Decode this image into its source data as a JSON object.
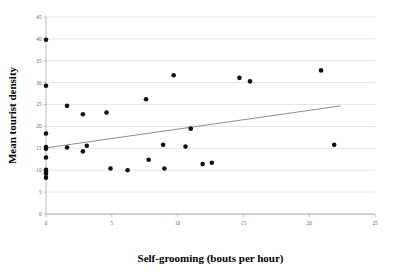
{
  "chart_data": {
    "type": "scatter",
    "title": "",
    "xlabel": "Self-grooming (bouts per hour)",
    "ylabel": "Mean tourist density",
    "xlim": [
      0,
      25
    ],
    "ylim": [
      0,
      45
    ],
    "xticks": [
      "0",
      "5",
      "10",
      "15",
      "20",
      "25"
    ],
    "xtick_values": [
      0,
      5,
      10,
      15,
      20,
      25
    ],
    "yticks": [
      "0",
      "5",
      "10",
      "15",
      "20",
      "25",
      "30",
      "35",
      "40",
      "45"
    ],
    "ytick_values": [
      0,
      5,
      10,
      15,
      20,
      25,
      30,
      35,
      40,
      45
    ],
    "grid": true,
    "legend": false,
    "legend_position": "none",
    "marker": "filled-circle",
    "marker_color": "#111111",
    "points": [
      {
        "x": 0.0,
        "y": 39.8
      },
      {
        "x": 0.0,
        "y": 29.3
      },
      {
        "x": 0.0,
        "y": 18.4
      },
      {
        "x": 0.0,
        "y": 15.3
      },
      {
        "x": 0.0,
        "y": 14.9
      },
      {
        "x": 0.0,
        "y": 12.9
      },
      {
        "x": 0.0,
        "y": 10.1
      },
      {
        "x": 0.0,
        "y": 9.6
      },
      {
        "x": 0.0,
        "y": 9.2
      },
      {
        "x": 0.0,
        "y": 8.3
      },
      {
        "x": 1.6,
        "y": 24.7
      },
      {
        "x": 1.6,
        "y": 15.2
      },
      {
        "x": 2.8,
        "y": 22.8
      },
      {
        "x": 2.8,
        "y": 14.3
      },
      {
        "x": 3.1,
        "y": 15.6
      },
      {
        "x": 4.6,
        "y": 23.2
      },
      {
        "x": 4.9,
        "y": 10.4
      },
      {
        "x": 6.2,
        "y": 10.0
      },
      {
        "x": 7.6,
        "y": 26.2
      },
      {
        "x": 7.8,
        "y": 12.4
      },
      {
        "x": 9.7,
        "y": 31.7
      },
      {
        "x": 9.0,
        "y": 10.4
      },
      {
        "x": 8.9,
        "y": 15.8
      },
      {
        "x": 11.0,
        "y": 19.5
      },
      {
        "x": 10.6,
        "y": 15.4
      },
      {
        "x": 11.9,
        "y": 11.4
      },
      {
        "x": 12.6,
        "y": 11.7
      },
      {
        "x": 14.7,
        "y": 31.1
      },
      {
        "x": 15.5,
        "y": 30.3
      },
      {
        "x": 20.9,
        "y": 32.8
      },
      {
        "x": 21.9,
        "y": 15.8
      }
    ],
    "trendline": {
      "type": "linear-fit",
      "x_start": 0.0,
      "y_start": 15.1,
      "x_end": 22.4,
      "y_end": 24.7,
      "color": "#707070"
    }
  }
}
